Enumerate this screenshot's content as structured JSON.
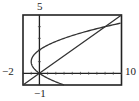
{
  "chart_data": {
    "type": "line",
    "title": "",
    "xlabel": "",
    "ylabel": "",
    "xlim": [
      -2,
      10
    ],
    "ylim": [
      -1,
      5
    ],
    "grid": false,
    "window_labels": {
      "xmin": "−2",
      "xmax": "10",
      "ymin": "−1",
      "ymax": "5"
    },
    "series": [
      {
        "name": "parabola x = y^2 - 2y",
        "points": [
          [
            3,
            -1
          ],
          [
            1.25,
            -0.5
          ],
          [
            0,
            0
          ],
          [
            -0.75,
            0.5
          ],
          [
            -1,
            1
          ],
          [
            -0.75,
            1.5
          ],
          [
            0,
            2
          ],
          [
            1.25,
            2.5
          ],
          [
            3,
            3
          ],
          [
            5.25,
            3.5
          ],
          [
            8,
            4
          ],
          [
            10,
            4.32
          ]
        ]
      },
      {
        "name": "line y = x/2",
        "points": [
          [
            -2,
            -1
          ],
          [
            0,
            0
          ],
          [
            8,
            4
          ],
          [
            10,
            5
          ]
        ]
      }
    ],
    "intersections": [
      [
        0,
        0
      ],
      [
        8,
        4
      ]
    ]
  },
  "colors": {
    "curve": "#333333",
    "frame": "#222222",
    "background": "#ffffff"
  }
}
